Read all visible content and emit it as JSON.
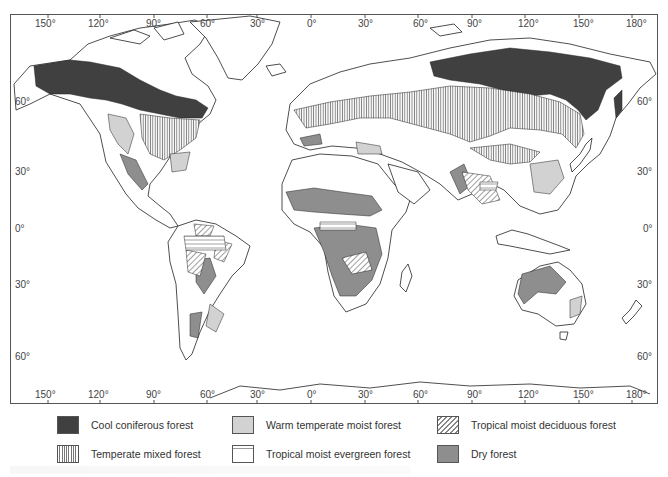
{
  "map": {
    "title": "World forest types map",
    "projection_frame": {
      "left_px": 10,
      "top_px": 14,
      "width_px": 648,
      "height_px": 390
    },
    "top_longitude_ticks": [
      {
        "label": "150°",
        "x": 48
      },
      {
        "label": "120°",
        "x": 100
      },
      {
        "label": "90°",
        "x": 154
      },
      {
        "label": "60°",
        "x": 207
      },
      {
        "label": "30°",
        "x": 257
      },
      {
        "label": "0°",
        "x": 311
      },
      {
        "label": "30°",
        "x": 365
      },
      {
        "label": "60°",
        "x": 418
      },
      {
        "label": "90°",
        "x": 472
      },
      {
        "label": "120°",
        "x": 525
      },
      {
        "label": "150°",
        "x": 579
      },
      {
        "label": "180°",
        "x": 632
      }
    ],
    "bottom_longitude_ticks": [
      {
        "label": "150°",
        "x": 48
      },
      {
        "label": "120°",
        "x": 100
      },
      {
        "label": "90°",
        "x": 154
      },
      {
        "label": "60°",
        "x": 207
      },
      {
        "label": "30°",
        "x": 257
      },
      {
        "label": "0°",
        "x": 311
      },
      {
        "label": "30°",
        "x": 365
      },
      {
        "label": "60°",
        "x": 418
      },
      {
        "label": "90°",
        "x": 472
      },
      {
        "label": "120°",
        "x": 525
      },
      {
        "label": "150°",
        "x": 579
      },
      {
        "label": "180°",
        "x": 632
      }
    ],
    "left_latitude_ticks": [
      {
        "label": "60°",
        "y": 102
      },
      {
        "label": "30°",
        "y": 172
      },
      {
        "label": "0°",
        "y": 229
      },
      {
        "label": "30°",
        "y": 285
      },
      {
        "label": "60°",
        "y": 357
      }
    ],
    "right_latitude_ticks": [
      {
        "label": "60°",
        "y": 102
      },
      {
        "label": "30°",
        "y": 172
      },
      {
        "label": "0°",
        "y": 229
      },
      {
        "label": "30°",
        "y": 285
      },
      {
        "label": "60°",
        "y": 357
      }
    ]
  },
  "legend": {
    "items": [
      {
        "key": "cool_coniferous",
        "label": "Cool coniferous forest",
        "color": "#404040",
        "pattern": "solid-dark"
      },
      {
        "key": "warm_temperate_moist",
        "label": "Warm temperate moist forest",
        "color": "#d2d2d2",
        "pattern": "solid-light"
      },
      {
        "key": "tropical_moist_deciduous",
        "label": "Tropical moist deciduous forest",
        "color": "#888888",
        "pattern": "diagonal-hatch"
      },
      {
        "key": "temperate_mixed",
        "label": "Temperate mixed forest",
        "color": "#777777",
        "pattern": "vertical-lines"
      },
      {
        "key": "tropical_moist_evergreen",
        "label": "Tropical moist evergreen forest",
        "color": "#999999",
        "pattern": "horizontal-lines"
      },
      {
        "key": "dry",
        "label": "Dry forest",
        "color": "#8e8e8e",
        "pattern": "solid-medium"
      }
    ]
  }
}
